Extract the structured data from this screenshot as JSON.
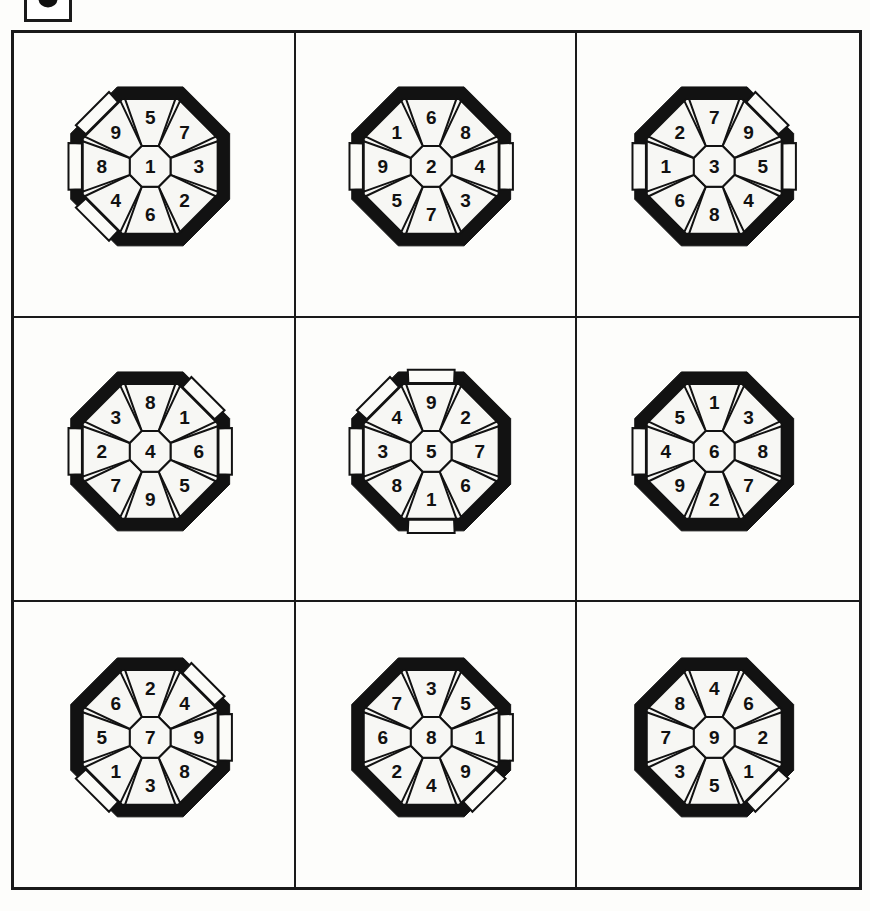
{
  "page": {
    "background_color": "#fdfdfb",
    "ink_color": "#1a1a1a"
  },
  "corner_badge": {
    "name": "partial-label-box",
    "glyph": ""
  },
  "grid": {
    "rows": 3,
    "columns": 3,
    "border_color": "#1a1a1a"
  },
  "puzzles": [
    {
      "id": "puzzle-1",
      "center": "1",
      "ring": [
        "5",
        "7",
        "3",
        "2",
        "6",
        "4",
        "8",
        "9"
      ],
      "ring_positions": [
        "top",
        "upper-right",
        "right",
        "lower-right",
        "bottom",
        "lower-left",
        "left",
        "upper-left"
      ],
      "breakout": [
        false,
        false,
        false,
        false,
        false,
        true,
        true,
        true
      ]
    },
    {
      "id": "puzzle-2",
      "center": "2",
      "ring": [
        "6",
        "8",
        "4",
        "3",
        "7",
        "5",
        "9",
        "1"
      ],
      "ring_positions": [
        "top",
        "upper-right",
        "right",
        "lower-right",
        "bottom",
        "lower-left",
        "left",
        "upper-left"
      ],
      "breakout": [
        false,
        false,
        true,
        false,
        false,
        false,
        true,
        false
      ]
    },
    {
      "id": "puzzle-3",
      "center": "3",
      "ring": [
        "7",
        "9",
        "5",
        "4",
        "8",
        "6",
        "1",
        "2"
      ],
      "ring_positions": [
        "top",
        "upper-right",
        "right",
        "lower-right",
        "bottom",
        "lower-left",
        "left",
        "upper-left"
      ],
      "breakout": [
        false,
        true,
        true,
        false,
        false,
        false,
        true,
        false
      ]
    },
    {
      "id": "puzzle-4",
      "center": "4",
      "ring": [
        "8",
        "1",
        "6",
        "5",
        "9",
        "7",
        "2",
        "3"
      ],
      "ring_positions": [
        "top",
        "upper-right",
        "right",
        "lower-right",
        "bottom",
        "lower-left",
        "left",
        "upper-left"
      ],
      "breakout": [
        false,
        true,
        true,
        false,
        false,
        false,
        true,
        false
      ]
    },
    {
      "id": "puzzle-5",
      "center": "5",
      "ring": [
        "9",
        "2",
        "7",
        "6",
        "1",
        "8",
        "3",
        "4"
      ],
      "ring_positions": [
        "top",
        "upper-right",
        "right",
        "lower-right",
        "bottom",
        "lower-left",
        "left",
        "upper-left"
      ],
      "breakout": [
        true,
        false,
        false,
        false,
        true,
        false,
        true,
        true
      ]
    },
    {
      "id": "puzzle-6",
      "center": "6",
      "ring": [
        "1",
        "3",
        "8",
        "7",
        "2",
        "9",
        "4",
        "5"
      ],
      "ring_positions": [
        "top",
        "upper-right",
        "right",
        "lower-right",
        "bottom",
        "lower-left",
        "left",
        "upper-left"
      ],
      "breakout": [
        false,
        false,
        false,
        false,
        false,
        false,
        true,
        false
      ]
    },
    {
      "id": "puzzle-7",
      "center": "7",
      "ring": [
        "2",
        "4",
        "9",
        "8",
        "3",
        "1",
        "5",
        "6"
      ],
      "ring_positions": [
        "top",
        "upper-right",
        "right",
        "lower-right",
        "bottom",
        "lower-left",
        "left",
        "upper-left"
      ],
      "breakout": [
        false,
        true,
        true,
        false,
        false,
        true,
        false,
        false
      ]
    },
    {
      "id": "puzzle-8",
      "center": "8",
      "ring": [
        "3",
        "5",
        "1",
        "9",
        "4",
        "2",
        "6",
        "7"
      ],
      "ring_positions": [
        "top",
        "upper-right",
        "right",
        "lower-right",
        "bottom",
        "lower-left",
        "left",
        "upper-left"
      ],
      "breakout": [
        false,
        false,
        true,
        true,
        false,
        false,
        false,
        false
      ]
    },
    {
      "id": "puzzle-9",
      "center": "9",
      "ring": [
        "4",
        "6",
        "2",
        "1",
        "5",
        "3",
        "7",
        "8"
      ],
      "ring_positions": [
        "top",
        "upper-right",
        "right",
        "lower-right",
        "bottom",
        "lower-left",
        "left",
        "upper-left"
      ],
      "breakout": [
        false,
        false,
        false,
        true,
        false,
        false,
        false,
        false
      ]
    }
  ]
}
